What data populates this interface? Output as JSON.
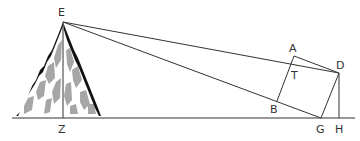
{
  "diagram": {
    "colors": {
      "line": "#333333",
      "mountain_outline": "#111111",
      "mountain_shading": "#a6a6a6",
      "background": "#ffffff"
    },
    "points": {
      "E": {
        "label": "E",
        "x": 63,
        "y": 22
      },
      "Z": {
        "label": "Z",
        "x": 63,
        "y": 118
      },
      "A": {
        "label": "A",
        "x": 294,
        "y": 56
      },
      "T": {
        "label": "T",
        "x": 291,
        "y": 68
      },
      "D": {
        "label": "D",
        "x": 339,
        "y": 73
      },
      "B": {
        "label": "B",
        "x": 277,
        "y": 101
      },
      "G": {
        "label": "G",
        "x": 321,
        "y": 118
      },
      "H": {
        "label": "H",
        "x": 339,
        "y": 118
      }
    },
    "labels": {
      "E": "E",
      "Z": "Z",
      "A": "A",
      "T": "T",
      "D": "D",
      "B": "B",
      "G": "G",
      "H": "H"
    },
    "segments": [
      [
        "E",
        "D"
      ],
      [
        "E",
        "G"
      ],
      [
        "E",
        "Z"
      ],
      [
        "A",
        "D"
      ],
      [
        "D",
        "G"
      ],
      [
        "A",
        "B"
      ],
      [
        "B",
        "G"
      ],
      [
        "D",
        "H"
      ]
    ],
    "ground_line": {
      "x1": 12,
      "x2": 355,
      "y": 118
    }
  }
}
